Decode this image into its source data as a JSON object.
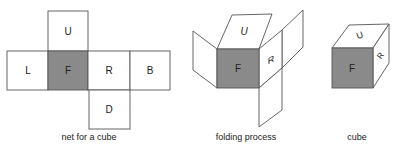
{
  "panels": [
    {
      "id": "net",
      "caption": "net for a cube",
      "faces": [
        {
          "label": "U"
        },
        {
          "label": "L"
        },
        {
          "label": "F",
          "shaded": true
        },
        {
          "label": "R"
        },
        {
          "label": "B"
        },
        {
          "label": "D"
        }
      ]
    },
    {
      "id": "folding",
      "caption": "folding process",
      "faces": [
        {
          "label": "U"
        },
        {
          "label": "F",
          "shaded": true
        },
        {
          "label": "R"
        }
      ]
    },
    {
      "id": "cube",
      "caption": "cube",
      "faces": [
        {
          "label": "U"
        },
        {
          "label": "F",
          "shaded": true
        },
        {
          "label": "R"
        }
      ]
    }
  ],
  "colors": {
    "front_face": "#8a8a8a",
    "stroke": "#555555"
  }
}
